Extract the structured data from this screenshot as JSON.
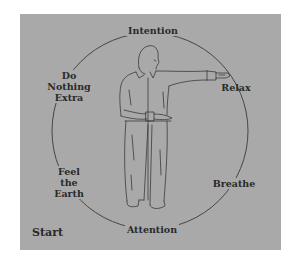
{
  "diagram": {
    "title": "",
    "background_color": "#a9a9a9",
    "line_color": "#3a3a3a",
    "text_color": "#2a2a2a",
    "center_figure": "standing man with right arm extended horizontally, left hand across waist",
    "cycle_labels": {
      "top": "Intention",
      "right_upper": {
        "lines": [
          "Relax"
        ]
      },
      "right_lower": {
        "lines": [
          "Breathe"
        ]
      },
      "bottom": "Attention",
      "left_lower": {
        "lines": [
          "Feel",
          "the",
          "Earth"
        ]
      },
      "left_upper": {
        "lines": [
          "Do",
          "Nothing",
          "Extra"
        ]
      }
    },
    "start_label": "Start"
  }
}
